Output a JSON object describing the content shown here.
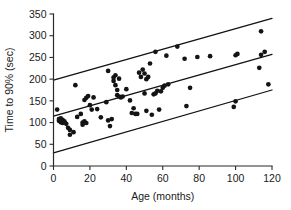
{
  "chart_data": {
    "type": "scatter",
    "title": "",
    "xlabel": "Age (months)",
    "ylabel": "Time to 90% (sec)",
    "xlim": [
      0,
      120
    ],
    "ylim": [
      0,
      350
    ],
    "xticks": [
      0,
      20,
      40,
      60,
      80,
      100,
      120
    ],
    "yticks": [
      0,
      50,
      100,
      150,
      200,
      250,
      300,
      350
    ],
    "grid": false,
    "legend": "none",
    "marker_color": "#141414",
    "line_color": "#111111",
    "axis_color": "#2b2b2b",
    "series": [
      {
        "name": "Time to 90% vs Age",
        "type": "scatter",
        "points": [
          [
            2,
            130
          ],
          [
            3,
            108
          ],
          [
            3,
            104
          ],
          [
            4,
            110
          ],
          [
            4,
            101
          ],
          [
            5,
            106
          ],
          [
            5,
            99
          ],
          [
            6,
            103
          ],
          [
            7,
            97
          ],
          [
            8,
            88
          ],
          [
            9,
            83
          ],
          [
            9,
            72
          ],
          [
            11,
            78
          ],
          [
            12,
            186
          ],
          [
            13,
            113
          ],
          [
            15,
            120
          ],
          [
            16,
            100
          ],
          [
            16,
            95
          ],
          [
            17,
            103
          ],
          [
            17,
            152
          ],
          [
            18,
            157
          ],
          [
            18,
            99
          ],
          [
            19,
            161
          ],
          [
            20,
            140
          ],
          [
            21,
            130
          ],
          [
            22,
            158
          ],
          [
            24,
            131
          ],
          [
            26,
            112
          ],
          [
            29,
            147
          ],
          [
            30,
            105
          ],
          [
            30,
            219
          ],
          [
            31,
            92
          ],
          [
            32,
            108
          ],
          [
            33,
            196
          ],
          [
            33,
            204
          ],
          [
            34,
            209
          ],
          [
            34,
            186
          ],
          [
            35,
            175
          ],
          [
            35,
            163
          ],
          [
            36,
            201
          ],
          [
            36,
            160
          ],
          [
            37,
            158
          ],
          [
            38,
            160
          ],
          [
            40,
            177
          ],
          [
            42,
            151
          ],
          [
            43,
            122
          ],
          [
            44,
            133
          ],
          [
            45,
            120
          ],
          [
            46,
            120
          ],
          [
            47,
            215
          ],
          [
            48,
            205
          ],
          [
            49,
            222
          ],
          [
            50,
            213
          ],
          [
            50,
            167
          ],
          [
            51,
            200
          ],
          [
            51,
            127
          ],
          [
            52,
            205
          ],
          [
            53,
            236
          ],
          [
            54,
            118
          ],
          [
            55,
            165
          ],
          [
            56,
            167
          ],
          [
            56,
            263
          ],
          [
            57,
            173
          ],
          [
            58,
            130
          ],
          [
            59,
            172
          ],
          [
            60,
            180
          ],
          [
            61,
            185
          ],
          [
            62,
            254
          ],
          [
            63,
            188
          ],
          [
            68,
            275
          ],
          [
            72,
            247
          ],
          [
            73,
            138
          ],
          [
            75,
            180
          ],
          [
            79,
            251
          ],
          [
            86,
            253
          ],
          [
            99,
            136
          ],
          [
            100,
            149
          ],
          [
            100,
            255
          ],
          [
            101,
            258
          ],
          [
            113,
            226
          ],
          [
            114,
            310
          ],
          [
            114,
            256
          ],
          [
            116,
            263
          ],
          [
            118,
            188
          ]
        ]
      },
      {
        "name": "upper prediction limit",
        "type": "line",
        "endpoints": [
          [
            0,
            198
          ],
          [
            120,
            340
          ]
        ]
      },
      {
        "name": "regression line",
        "type": "line",
        "endpoints": [
          [
            0,
            115
          ],
          [
            120,
            257
          ]
        ]
      },
      {
        "name": "lower prediction limit",
        "type": "line",
        "endpoints": [
          [
            0,
            30
          ],
          [
            120,
            175
          ]
        ]
      }
    ]
  },
  "axes": {
    "x_title": "Age (months)",
    "y_title": "Time to 90% (sec)",
    "x_tick_labels": [
      "0",
      "20",
      "40",
      "60",
      "80",
      "100",
      "120"
    ],
    "y_tick_labels": [
      "0",
      "50",
      "100",
      "150",
      "200",
      "250",
      "300",
      "350"
    ]
  }
}
